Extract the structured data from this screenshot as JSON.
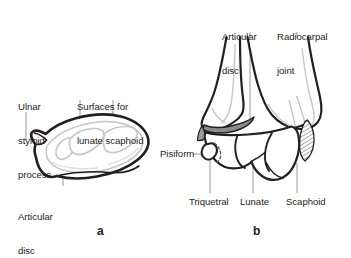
{
  "figure": {
    "background_color": "#ffffff",
    "outline_color": "#231f20",
    "shade_color": "#8c8c8c",
    "light_line_color": "#c9c9c9",
    "leader_color": "#9a9a9a",
    "panels": [
      {
        "id": "a",
        "letter": "a",
        "caption": "Distal articular surface of radius and ulna (superior view)",
        "labels": [
          {
            "name": "ulnar-styloid-process",
            "text": "Ulnar\nstyloid\nprocess"
          },
          {
            "name": "surfaces-for-lunate-scaphoid",
            "text": "Surfaces for\nlunate scaphoid"
          },
          {
            "name": "articular-disc",
            "text": "Articular\ndisc"
          }
        ]
      },
      {
        "id": "b",
        "letter": "b",
        "caption": "Coronal section of the wrist showing the radiocarpal joint",
        "labels": [
          {
            "name": "articular-disc",
            "text": "Articular\ndisc"
          },
          {
            "name": "radiocarpal-joint",
            "text": "Radiocarpal\njoint"
          },
          {
            "name": "pisiform",
            "text": "Pisiform"
          },
          {
            "name": "triquetral",
            "text": "Triquetral"
          },
          {
            "name": "lunate",
            "text": "Lunate"
          },
          {
            "name": "scaphoid",
            "text": "Scaphoid"
          }
        ]
      }
    ]
  },
  "labels": {
    "ulnar_styloid_l1": "Ulnar",
    "ulnar_styloid_l2": "styloid",
    "ulnar_styloid_l3": "process",
    "surfaces_l1": "Surfaces for",
    "surfaces_l2": "lunate scaphoid",
    "articular_disc_a_l1": "Articular",
    "articular_disc_a_l2": "disc",
    "articular_disc_b_l1": "Articular",
    "articular_disc_b_l2": "disc",
    "radiocarpal_l1": "Radiocarpal",
    "radiocarpal_l2": "joint",
    "pisiform": "Pisiform",
    "triquetral": "Triquetral",
    "lunate": "Lunate",
    "scaphoid": "Scaphoid",
    "letter_a": "a",
    "letter_b": "b"
  }
}
